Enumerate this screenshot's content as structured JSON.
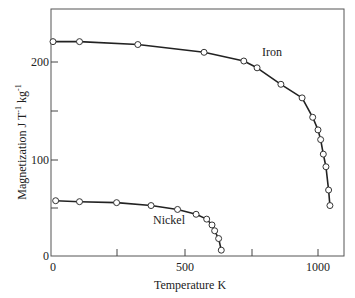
{
  "chart_data": {
    "type": "line",
    "title": "",
    "xlabel": "Temperature K",
    "ylabel": "Magnetization J T⁻¹ kg⁻¹",
    "xlim": [
      0,
      1100
    ],
    "ylim": [
      0,
      235
    ],
    "xticks": [
      0,
      500,
      1000
    ],
    "xtick_labels": [
      "0",
      "500",
      "1000"
    ],
    "xminor_ticks": [
      250,
      750
    ],
    "yticks": [
      0,
      100,
      200
    ],
    "ytick_labels": [
      "0",
      "100",
      "200"
    ],
    "yminor_ticks": [
      50,
      150
    ],
    "grid": false,
    "legend": "inline annotations",
    "series": [
      {
        "name": "Iron",
        "label_position": [
          870,
          205
        ],
        "markers": "open-circle",
        "x": [
          0,
          100,
          320,
          570,
          720,
          770,
          860,
          940,
          980,
          1000,
          1010,
          1020,
          1030,
          1040,
          1045
        ],
        "y": [
          221,
          221,
          218,
          210,
          201,
          194,
          177,
          163,
          143,
          130,
          120,
          105,
          92,
          68,
          52
        ]
      },
      {
        "name": "Nickel",
        "label_position": [
          400,
          78
        ],
        "markers": "open-circle",
        "x": [
          10,
          100,
          240,
          370,
          470,
          540,
          580,
          600,
          610,
          625,
          635
        ],
        "y": [
          57,
          56,
          55,
          52,
          48,
          43,
          38,
          32,
          26,
          18,
          6
        ]
      }
    ]
  },
  "labels": {
    "x_axis": "Temperature K",
    "y_axis_main": "Magnetization J T",
    "y_axis_sup1": "-1",
    "y_axis_mid": " kg",
    "y_axis_sup2": "-1",
    "iron": "Iron",
    "nickel": "Nickel",
    "x0": "0",
    "x500": "500",
    "x1000": "1000",
    "y0": "0",
    "y100": "100",
    "y200": "200"
  }
}
